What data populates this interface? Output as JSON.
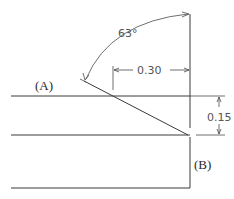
{
  "diagram": {
    "type": "technical-drawing",
    "angle_label": "63°",
    "horizontal_dimension": "0.30",
    "vertical_dimension": "0.15",
    "point_a_label": "(A)",
    "point_b_label": "(B)"
  },
  "colors": {
    "line": "#3a3a3a",
    "dimension_text": "#555555",
    "label_text": "#2a2a2a",
    "background": "#ffffff"
  }
}
